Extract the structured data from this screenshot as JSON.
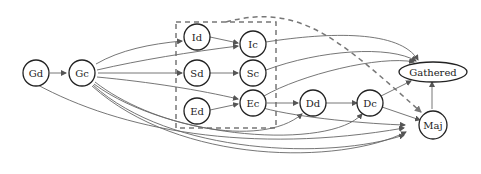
{
  "diagram": {
    "nodes": {
      "Gd": "Gd",
      "Gc": "Gc",
      "Id": "Id",
      "Ic": "Ic",
      "Sd": "Sd",
      "Sc": "Sc",
      "Ed": "Ed",
      "Ec": "Ec",
      "Dd": "Dd",
      "Dc": "Dc",
      "Gathered": "Gathered",
      "Maj": "Maj"
    },
    "colors": {
      "node_stroke": "#222222",
      "edge": "#666666",
      "dashed": "#777777"
    },
    "edges": [
      "Gd->Gc",
      "Gd->Maj",
      "Gc->Id",
      "Gc->Ic",
      "Gc->Sd",
      "Gc->Ec",
      "Gc->Dd",
      "Gc->Dc",
      "Gc->Maj",
      "Gc->Gathered",
      "Id->Ic",
      "Sd->Sc",
      "Ed->Ec",
      "Ic->Gathered",
      "Sc->Gathered",
      "Ec->Gathered",
      "Ec->Dd",
      "Ec->Maj",
      "Dd->Dc",
      "Dc->Gathered",
      "Dc->Maj",
      "Maj->Gathered",
      "Group(dashed)->Maj"
    ]
  }
}
